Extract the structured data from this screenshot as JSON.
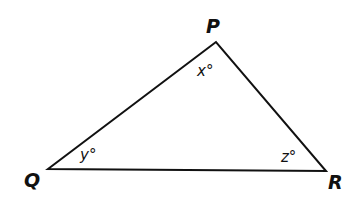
{
  "diagram": {
    "type": "triangle",
    "stroke_color": "#111111",
    "vertices": [
      {
        "id": "P",
        "label": "P",
        "x": 216,
        "y": 42
      },
      {
        "id": "Q",
        "label": "Q",
        "x": 48,
        "y": 169
      },
      {
        "id": "R",
        "label": "R",
        "x": 326,
        "y": 171
      }
    ],
    "angles": [
      {
        "vertex": "P",
        "label": "x°"
      },
      {
        "vertex": "Q",
        "label": "y°"
      },
      {
        "vertex": "R",
        "label": "z°"
      }
    ]
  }
}
